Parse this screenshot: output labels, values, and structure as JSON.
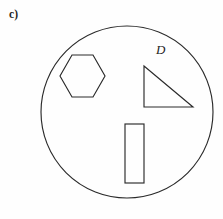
{
  "figure": {
    "part_label": "c)",
    "set_label": "D",
    "background_color": "#fefefe",
    "stroke_color": "#2a2a2a",
    "fill_color": "none",
    "stroke_width": 1.15
  },
  "diagram_data": {
    "type": "set-diagram",
    "description": "Circle labeled D containing a hexagon, a right triangle and a vertical rectangle",
    "canvas": {
      "width": 223,
      "height": 219
    },
    "shapes": [
      {
        "name": "universe-circle",
        "kind": "circle",
        "label": "D",
        "cx": 127,
        "cy": 112,
        "r": 86
      },
      {
        "name": "hexagon",
        "kind": "polygon",
        "sides": 6,
        "points": "72,55 93,55 105,76 93,97 72,97 60,76"
      },
      {
        "name": "right-triangle",
        "kind": "polygon",
        "sides": 3,
        "points": "144,66 193,107 144,107"
      },
      {
        "name": "rectangle",
        "kind": "rect",
        "x": 125,
        "y": 124,
        "width": 19,
        "height": 59
      }
    ],
    "labels": [
      {
        "name": "part-label",
        "text": "c)",
        "x": 9,
        "y": 9,
        "style": "bold"
      },
      {
        "name": "set-label",
        "text": "D",
        "x": 156,
        "y": 43,
        "style": "italic"
      }
    ]
  }
}
